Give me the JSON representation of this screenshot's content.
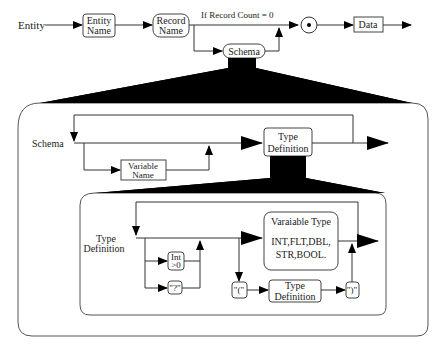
{
  "diagram": {
    "top_row": {
      "entity_label": "Entity",
      "entity_name_box": [
        "Entity",
        "Name"
      ],
      "record_name_box": [
        "Record",
        "Name"
      ],
      "condition_label": "If Record Count = 0",
      "schema_box": "Schema",
      "junction_icon": "dot-circle",
      "data_box": "Data"
    },
    "schema_panel": {
      "entry_label": "Schema",
      "variable_name_box": [
        "Variable",
        "Name"
      ],
      "type_definition_box": [
        "Type",
        "Definition"
      ]
    },
    "type_definition_panel": {
      "entry_label": [
        "Type",
        "Definition"
      ],
      "int_box": [
        "Int",
        ">0"
      ],
      "question_box": "\"?\"",
      "variable_type_box": {
        "title": "Varaiable Type",
        "types_line1": "INT,FLT,DBL,",
        "types_line2": "STR,BOOL."
      },
      "open_paren_box": "\"(\"",
      "nested_type_definition_box": [
        "Type",
        "Definition"
      ],
      "close_paren_box": "\")\""
    }
  }
}
